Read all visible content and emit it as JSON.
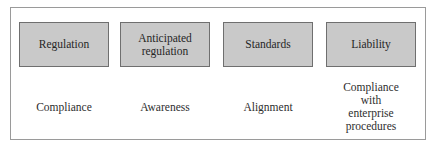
{
  "diagram": {
    "columns": [
      {
        "header": "Regulation",
        "response": "Compliance"
      },
      {
        "header": "Anticipated\nregulation",
        "response": "Awareness"
      },
      {
        "header": "Standards",
        "response": "Alignment"
      },
      {
        "header": "Liability",
        "response": "Compliance\nwith\nenterprise\nprocedures"
      }
    ],
    "colors": {
      "box_fill": "#c9c9c9",
      "box_border": "#6f6f6f",
      "frame_border": "#9a9a9a",
      "text": "#2a2a2a"
    }
  }
}
